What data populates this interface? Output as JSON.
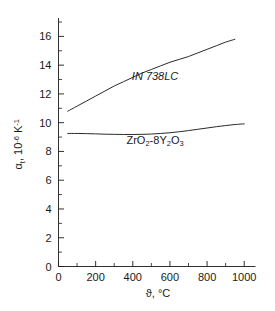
{
  "chart_data": {
    "type": "line",
    "title": "",
    "subtitle": "",
    "xlabel": "ϑ, °C",
    "xlabel_symbol": "ϑ",
    "xlabel_unit": ", °C",
    "ylabel": "αt, 10-6 K-1",
    "ylabel_symbol": "α",
    "ylabel_sub": "t",
    "ylabel_mid": ", 10",
    "ylabel_sup1": "-6",
    "ylabel_k": " K",
    "ylabel_sup2": "-1",
    "xlim": [
      0,
      1050
    ],
    "ylim": [
      0,
      17
    ],
    "grid": false,
    "legend": "inline-labels",
    "xticks": [
      0,
      200,
      400,
      600,
      800,
      1000
    ],
    "xtick_labels": [
      "0",
      "200",
      "400",
      "600",
      "800",
      "1000"
    ],
    "xticks_minor": [
      100,
      300,
      500,
      700,
      900
    ],
    "yticks": [
      0,
      2,
      4,
      6,
      8,
      10,
      12,
      14,
      16
    ],
    "ytick_labels": [
      "0",
      "2",
      "4",
      "6",
      "8",
      "10",
      "12",
      "14",
      "16"
    ],
    "yticks_minor": [
      1,
      3,
      5,
      7,
      9,
      11,
      13,
      15,
      17
    ],
    "series": [
      {
        "name": "IN 738LC",
        "label_display": "IN 738LC",
        "italic": true,
        "label_x": 520,
        "label_y": 13.0,
        "x": [
          50,
          100,
          150,
          200,
          250,
          300,
          350,
          400,
          450,
          500,
          550,
          600,
          650,
          700,
          750,
          800,
          850,
          900,
          950
        ],
        "y": [
          10.8,
          11.15,
          11.5,
          11.85,
          12.2,
          12.55,
          12.85,
          13.15,
          13.45,
          13.7,
          13.95,
          14.2,
          14.4,
          14.6,
          14.85,
          15.1,
          15.35,
          15.6,
          15.8
        ]
      },
      {
        "name": "ZrO2-8Y2O3",
        "label_display": "ZrO2-8Y2O3",
        "italic": false,
        "label_parts": [
          {
            "t": "ZrO",
            "k": "n"
          },
          {
            "t": "2",
            "k": "sub"
          },
          {
            "t": "-8Y",
            "k": "n"
          },
          {
            "t": "2",
            "k": "sub"
          },
          {
            "t": "O",
            "k": "n"
          },
          {
            "t": "3",
            "k": "sub"
          }
        ],
        "label_x": 520,
        "label_y": 8.55,
        "x": [
          50,
          100,
          150,
          200,
          250,
          300,
          350,
          400,
          450,
          500,
          550,
          600,
          650,
          700,
          750,
          800,
          850,
          900,
          950,
          1000
        ],
        "y": [
          9.25,
          9.25,
          9.24,
          9.22,
          9.2,
          9.19,
          9.18,
          9.18,
          9.19,
          9.21,
          9.25,
          9.3,
          9.37,
          9.45,
          9.54,
          9.63,
          9.72,
          9.8,
          9.87,
          9.92
        ]
      }
    ]
  },
  "colors": {
    "axis": "#1a1a1a",
    "curve": "#2a2a2a",
    "background": "#ffffff"
  }
}
